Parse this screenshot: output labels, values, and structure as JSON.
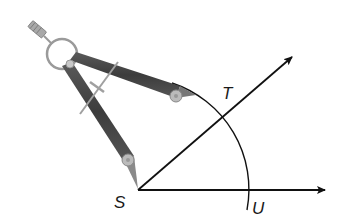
{
  "diagram": {
    "title": "",
    "points": {
      "S": {
        "label": "S"
      },
      "T": {
        "label": "T"
      },
      "U": {
        "label": "U"
      }
    },
    "elements": [
      "ray ST",
      "ray SU",
      "arc centered at S through T and U",
      "compass drawing arc"
    ],
    "colors": {
      "line": "#111111",
      "compass_leg": "#4a4a4a",
      "compass_metal": "#9a9a9a"
    }
  }
}
